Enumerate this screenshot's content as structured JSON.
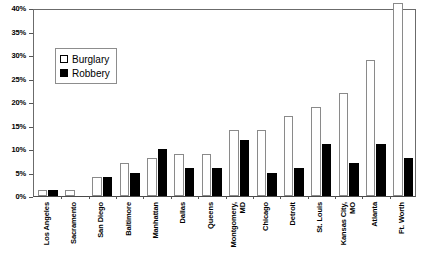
{
  "chart_data": {
    "type": "bar",
    "title": "",
    "subtitle": "",
    "xlabel": "",
    "ylabel": "",
    "ylim": [
      0,
      40
    ],
    "ytick_labels": [
      "0%",
      "5%",
      "10%",
      "15%",
      "20%",
      "25%",
      "30%",
      "35%",
      "40%"
    ],
    "ytick_values": [
      0,
      5,
      10,
      15,
      20,
      25,
      30,
      35,
      40
    ],
    "grid": false,
    "legend_position": "inside-upper-left",
    "categories": [
      "Los Angeles",
      "Sacramento",
      "San Diego",
      "Baltimore",
      "Manhattan",
      "Dallas",
      "Queens",
      "Montgomery, MD",
      "Chicago",
      "Detroit",
      "St. Louis",
      "Kansas City, MO",
      "Atlanta",
      "Ft. Worth"
    ],
    "category_label_lines": [
      [
        "Los Angeles"
      ],
      [
        "Sacramento"
      ],
      [
        "San Diego"
      ],
      [
        "Baltimore"
      ],
      [
        "Manhattan"
      ],
      [
        "Dallas"
      ],
      [
        "Queens"
      ],
      [
        "Montgomery,",
        "MD"
      ],
      [
        "Chicago"
      ],
      [
        "Detroit"
      ],
      [
        "St. Louis"
      ],
      [
        "Kansas City,",
        "MO"
      ],
      [
        "Atlanta"
      ],
      [
        "Ft. Worth"
      ]
    ],
    "series": [
      {
        "name": "Burglary",
        "color": "#ffffff",
        "edge_color": "#8a8a8a",
        "values": [
          1.2,
          1.2,
          4.0,
          7.0,
          8.0,
          9.0,
          9.0,
          14.0,
          14.0,
          17.0,
          19.0,
          22.0,
          29.0,
          41.0
        ]
      },
      {
        "name": "Robbery",
        "color": "#000000",
        "edge_color": "#000000",
        "values": [
          1.2,
          0.0,
          4.0,
          5.0,
          10.0,
          6.0,
          6.0,
          12.0,
          5.0,
          6.0,
          11.0,
          7.0,
          11.0,
          8.0
        ]
      }
    ]
  },
  "legend": {
    "items": [
      {
        "label": "Burglary",
        "swatch": "white-square-outline-icon"
      },
      {
        "label": "Robbery",
        "swatch": "black-square-icon"
      }
    ]
  }
}
